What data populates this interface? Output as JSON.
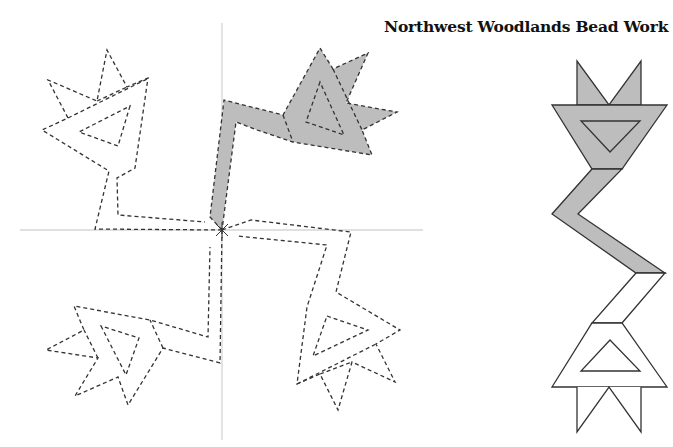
{
  "title": "Northwest Woodlands Bead Work",
  "colors": {
    "fill": "#bdbdbd",
    "stroke": "#333333",
    "axis": "#d6d6d6",
    "background": "#ffffff"
  },
  "left_figure": {
    "description": "Four rotated copies of the bead motif around an origin (pinwheel), one shaded, three dashed outlines",
    "axes": {
      "horizontal": {
        "x1": 20,
        "x2": 423,
        "y": 230
      },
      "vertical": {
        "x": 222,
        "y1": 23,
        "y2": 440
      }
    },
    "origin": [
      222,
      230
    ],
    "shaded_copy": "upper-right quadrant",
    "outline_style": "dashed"
  },
  "right_figure": {
    "description": "Original motif: double-point crown, inverted trapezoid with triangle, zigzag band, trapezoid with triangle, double-point base",
    "shaded_part": "top crown, upper trapezoid and zigzag band",
    "unshaded_part": "lower band, lower trapezoid and base points"
  }
}
